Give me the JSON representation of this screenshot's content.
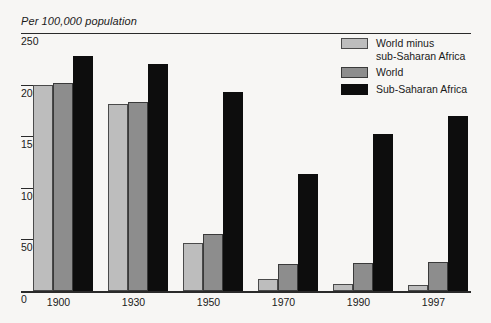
{
  "chart_data": {
    "type": "bar",
    "title": "Per 100,000 population",
    "xlabel": "",
    "ylabel": "",
    "ylim": [
      0,
      250
    ],
    "yticks": [
      0,
      50,
      100,
      150,
      200,
      250
    ],
    "grid": true,
    "legend_position": "top-right",
    "categories": [
      "1900",
      "1930",
      "1950",
      "1970",
      "1990",
      "1997"
    ],
    "series": [
      {
        "name": "World minus\nsub-Saharan Africa",
        "color": "#bdbdbd",
        "values": [
          200,
          181,
          47,
          12,
          7,
          6
        ]
      },
      {
        "name": "World",
        "color": "#8d8d8d",
        "values": [
          202,
          183,
          55,
          26,
          27,
          28
        ]
      },
      {
        "name": "Sub-Saharan Africa",
        "color": "#0d0d0d",
        "values": [
          228,
          220,
          193,
          113,
          152,
          170
        ]
      }
    ]
  },
  "axis": {
    "tick_labels": [
      "250",
      "200",
      "150",
      "100",
      "50",
      "0"
    ]
  }
}
